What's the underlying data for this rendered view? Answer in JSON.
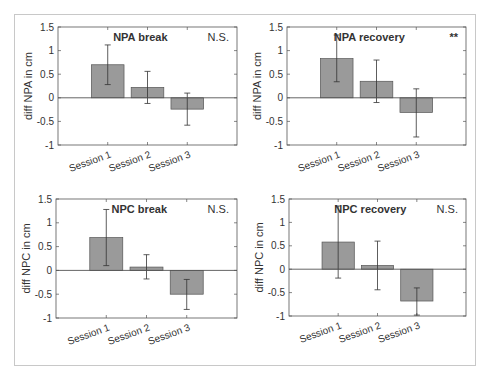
{
  "chart_data": [
    {
      "type": "bar",
      "title": "NPA break",
      "annotation": "N.S.",
      "xlabel": "",
      "ylabel": "diff NPA in cm",
      "categories": [
        "Session 1",
        "Session 2",
        "Session 3"
      ],
      "values": [
        0.7,
        0.22,
        -0.24
      ],
      "error_low": [
        0.28,
        -0.12,
        -0.58
      ],
      "error_high": [
        1.12,
        0.56,
        0.1
      ],
      "ylim": [
        -1,
        1.5
      ],
      "yticks": [
        -1,
        -0.5,
        0,
        0.5,
        1,
        1.5
      ],
      "ytick_labels": [
        "-1",
        "-0.5",
        "0",
        "0.5",
        "1",
        "1.5"
      ],
      "grid": false
    },
    {
      "type": "bar",
      "title": "NPA recovery",
      "annotation": "**",
      "xlabel": "",
      "ylabel": "diff NPA in cm",
      "categories": [
        "Session 1",
        "Session 2",
        "Session 3"
      ],
      "values": [
        0.83,
        0.35,
        -0.31
      ],
      "error_low": [
        0.34,
        -0.1,
        -0.83
      ],
      "error_high": [
        1.33,
        0.8,
        0.19
      ],
      "ylim": [
        -1,
        1.5
      ],
      "yticks": [
        -1,
        -0.5,
        0,
        0.5,
        1,
        1.5
      ],
      "ytick_labels": [
        "-1",
        "-0.5",
        "0",
        "0.5",
        "1",
        "1.5"
      ],
      "grid": false
    },
    {
      "type": "bar",
      "title": "NPC break",
      "annotation": "N.S.",
      "xlabel": "",
      "ylabel": "diff NPC in cm",
      "categories": [
        "Session 1",
        "Session 2",
        "Session 3"
      ],
      "values": [
        0.69,
        0.07,
        -0.5
      ],
      "error_low": [
        0.1,
        -0.18,
        -0.82
      ],
      "error_high": [
        1.28,
        0.33,
        -0.19
      ],
      "ylim": [
        -1,
        1.5
      ],
      "yticks": [
        -1,
        -0.5,
        0,
        0.5,
        1,
        1.5
      ],
      "ytick_labels": [
        "-1",
        "-0.5",
        "0",
        "0.5",
        "1",
        "1.5"
      ],
      "grid": false
    },
    {
      "type": "bar",
      "title": "NPC recovery",
      "annotation": "N.S.",
      "xlabel": "",
      "ylabel": "diff NPC in cm",
      "categories": [
        "Session 1",
        "Session 2",
        "Session 3"
      ],
      "values": [
        0.58,
        0.08,
        -0.68
      ],
      "error_low": [
        -0.19,
        -0.44,
        -0.98
      ],
      "error_high": [
        1.35,
        0.6,
        -0.4
      ],
      "ylim": [
        -1,
        1.5
      ],
      "yticks": [
        -1,
        -0.5,
        0,
        0.5,
        1,
        1.5
      ],
      "ytick_labels": [
        "-1",
        "-0.5",
        "0",
        "0.5",
        "1",
        "1.5"
      ],
      "grid": false
    }
  ],
  "style": {
    "bar_fill": "#9a9a9a",
    "bar_edge": "#555555",
    "axis_color": "#555555",
    "errorbar_color": "#333333",
    "frame_border": "#c8c8c8"
  },
  "layout": {
    "panels": [
      {
        "left": 58,
        "right": 237,
        "top": 27,
        "bottom": 145
      },
      {
        "left": 287,
        "right": 466,
        "top": 27,
        "bottom": 145
      },
      {
        "left": 56,
        "right": 237,
        "top": 199,
        "bottom": 318
      },
      {
        "left": 289,
        "right": 466,
        "top": 199,
        "bottom": 316
      }
    ]
  }
}
